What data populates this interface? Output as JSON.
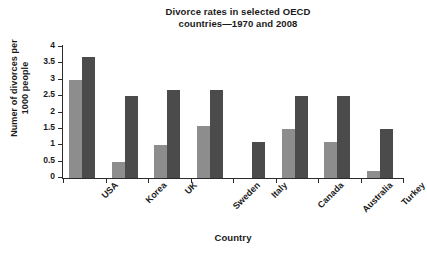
{
  "chart_data": {
    "type": "bar",
    "title": "Divorce rates in selected OECD countries—1970 and 2008",
    "title_lines": [
      "Divorce rates in selected OECD",
      "countries—1970 and 2008"
    ],
    "xlabel": "Country",
    "ylabel": "Numer of divorces per 1000 people",
    "ylabel_lines": [
      "Numer of divorces per",
      "1000 people"
    ],
    "categories": [
      "USA",
      "Korea",
      "UK",
      "Sweden",
      "Italy",
      "Canada",
      "Australia",
      "Turkey"
    ],
    "series": [
      {
        "name": "1970",
        "color": "#8d8d8d",
        "values": [
          3.0,
          0.5,
          1.0,
          1.6,
          0.0,
          1.5,
          1.1,
          0.2
        ]
      },
      {
        "name": "2008",
        "color": "#4b4b4b",
        "values": [
          3.7,
          2.5,
          2.7,
          2.7,
          1.1,
          2.5,
          2.5,
          1.5
        ]
      }
    ],
    "ylim": [
      0,
      4
    ],
    "ytick_labels": [
      "0",
      "0.5",
      "1",
      "1.5",
      "2",
      "2.5",
      "3",
      "3.5",
      "4"
    ],
    "ytick_values": [
      0,
      0.5,
      1,
      1.5,
      2,
      2.5,
      3,
      3.5,
      4
    ],
    "grid": false,
    "legend": "none",
    "background": "#ffffff",
    "axis_color": "#2b2b2b"
  }
}
